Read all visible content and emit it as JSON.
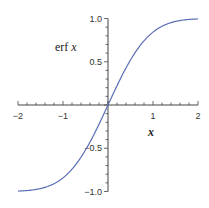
{
  "chart_data": {
    "type": "line",
    "title": "",
    "xlabel": "x",
    "ylabel": "erf x",
    "xlim": [
      -2,
      2
    ],
    "ylim": [
      -1,
      1
    ],
    "grid": false,
    "legend": null,
    "x_ticks": [
      "-2",
      "-1",
      "1",
      "2"
    ],
    "y_ticks": [
      "1.0",
      "0.5",
      "-0.5",
      "-1.0"
    ],
    "series": [
      {
        "name": "erf x",
        "color": "#5a6fb5",
        "x": [
          -2.0,
          -1.75,
          -1.5,
          -1.25,
          -1.0,
          -0.75,
          -0.5,
          -0.25,
          0.0,
          0.25,
          0.5,
          0.75,
          1.0,
          1.25,
          1.5,
          1.75,
          2.0
        ],
        "y": [
          -0.995,
          -0.987,
          -0.966,
          -0.923,
          -0.843,
          -0.711,
          -0.52,
          -0.276,
          0.0,
          0.276,
          0.52,
          0.711,
          0.843,
          0.923,
          0.966,
          0.987,
          0.995
        ]
      }
    ]
  },
  "labels": {
    "ylabel_prefix": "erf",
    "ylabel_var": "x",
    "xlabel": "x"
  }
}
